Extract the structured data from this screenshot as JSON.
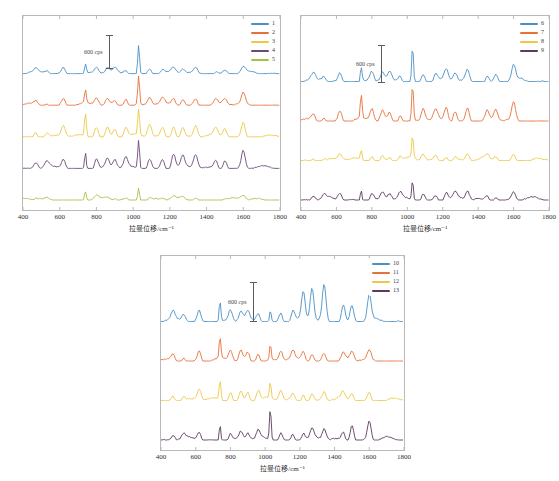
{
  "figure": {
    "background": "#ffffff",
    "frame_color": "#b9b9b9",
    "panel_count": 3
  },
  "axis": {
    "xlabel": "拉曼位移/cm⁻¹",
    "xticks": [
      "400",
      "600",
      "800",
      "1000",
      "1200",
      "1400",
      "1600",
      "1800"
    ],
    "xmin": 400,
    "xmax": 1800
  },
  "scalebar": {
    "label": "600 cps",
    "value": 600,
    "unit": "cps"
  },
  "colors": {
    "blue": "#4a90c4",
    "orange": "#e8703a",
    "yellow": "#edc847",
    "purple": "#6b4a77",
    "dark_purple": "#5b3a5e",
    "green": "#a8c04a"
  },
  "panels": [
    {
      "id": "panel-1",
      "legend": [
        {
          "label": "1",
          "color": "#4a90c4"
        },
        {
          "label": "2",
          "color": "#e8703a"
        },
        {
          "label": "3",
          "color": "#edc847"
        },
        {
          "label": "4",
          "color": "#6b4a77"
        },
        {
          "label": "5",
          "color": "#a8c04a"
        }
      ]
    },
    {
      "id": "panel-2",
      "legend": [
        {
          "label": "6",
          "color": "#4a90c4"
        },
        {
          "label": "7",
          "color": "#e8703a"
        },
        {
          "label": "8",
          "color": "#edc847"
        },
        {
          "label": "9",
          "color": "#5b3a5e"
        }
      ]
    },
    {
      "id": "panel-3",
      "legend": [
        {
          "label": "10",
          "color": "#4a90c4"
        },
        {
          "label": "11",
          "color": "#e8703a"
        },
        {
          "label": "12",
          "color": "#edc847"
        },
        {
          "label": "13",
          "color": "#5b3a5e"
        }
      ]
    }
  ],
  "chart_data": [
    {
      "type": "line",
      "title": "",
      "xlabel": "拉曼位移/cm⁻¹",
      "ylabel": "",
      "xlim": [
        400,
        1800
      ],
      "grid": false,
      "legend_position": "top-right",
      "note": "Stacked offset Raman spectra, samples 1-5. Intensity scale bar = 600 cps.",
      "series": [
        {
          "name": "1",
          "color": "#4a90c4",
          "offset_index": 0,
          "peaks_cm1": [
            470,
            530,
            620,
            740,
            800,
            860,
            900,
            960,
            1030,
            1090,
            1160,
            1220,
            1270,
            1340,
            1450,
            1500,
            1600
          ],
          "peak_rel_intensity": [
            0.12,
            0.1,
            0.2,
            0.34,
            0.2,
            0.17,
            0.14,
            0.13,
            1.0,
            0.22,
            0.13,
            0.16,
            0.15,
            0.18,
            0.11,
            0.12,
            0.19
          ]
        },
        {
          "name": "2",
          "color": "#e8703a",
          "offset_index": 1,
          "peaks_cm1": [
            470,
            530,
            620,
            740,
            800,
            860,
            900,
            960,
            1030,
            1090,
            1160,
            1220,
            1270,
            1340,
            1450,
            1500,
            1600
          ],
          "peak_rel_intensity": [
            0.14,
            0.12,
            0.26,
            0.45,
            0.25,
            0.22,
            0.18,
            0.3,
            1.0,
            0.28,
            0.2,
            0.24,
            0.22,
            0.26,
            0.18,
            0.2,
            0.4
          ]
        },
        {
          "name": "3",
          "color": "#edc847",
          "offset_index": 2,
          "peaks_cm1": [
            470,
            530,
            620,
            740,
            800,
            860,
            900,
            960,
            1030,
            1090,
            1160,
            1220,
            1270,
            1340,
            1450,
            1500,
            1600
          ],
          "peak_rel_intensity": [
            0.2,
            0.18,
            0.36,
            0.78,
            0.4,
            0.34,
            0.3,
            0.32,
            0.9,
            0.42,
            0.3,
            0.42,
            0.34,
            0.38,
            0.26,
            0.3,
            0.52
          ]
        },
        {
          "name": "4",
          "color": "#6b4a77",
          "offset_index": 3,
          "peaks_cm1": [
            470,
            530,
            620,
            740,
            800,
            860,
            900,
            960,
            1030,
            1090,
            1160,
            1220,
            1270,
            1340,
            1450,
            1500,
            1600
          ],
          "peak_rel_intensity": [
            0.22,
            0.2,
            0.34,
            0.6,
            0.36,
            0.32,
            0.3,
            0.34,
            1.0,
            0.38,
            0.34,
            0.52,
            0.4,
            0.46,
            0.3,
            0.36,
            0.62
          ]
        },
        {
          "name": "5",
          "color": "#a8c04a",
          "offset_index": 4,
          "peaks_cm1": [
            470,
            530,
            620,
            740,
            800,
            860,
            900,
            960,
            1030,
            1090,
            1160,
            1220,
            1270,
            1340,
            1450,
            1500,
            1600
          ],
          "peak_rel_intensity": [
            0.04,
            0.04,
            0.06,
            0.34,
            0.1,
            0.06,
            0.05,
            0.06,
            0.52,
            0.08,
            0.05,
            0.08,
            0.07,
            0.12,
            0.05,
            0.06,
            0.14
          ]
        }
      ]
    },
    {
      "type": "line",
      "title": "",
      "xlabel": "拉曼位移/cm⁻¹",
      "ylabel": "",
      "xlim": [
        400,
        1800
      ],
      "grid": false,
      "legend_position": "top-right",
      "note": "Stacked offset Raman spectra, samples 6-9. Intensity scale bar = 600 cps.",
      "series": [
        {
          "name": "6",
          "color": "#4a90c4",
          "offset_index": 0,
          "peaks_cm1": [
            470,
            530,
            620,
            740,
            800,
            860,
            900,
            960,
            1030,
            1090,
            1160,
            1220,
            1270,
            1340,
            1450,
            1500,
            1600
          ],
          "peak_rel_intensity": [
            0.16,
            0.14,
            0.24,
            0.4,
            0.26,
            0.22,
            0.2,
            0.18,
            1.0,
            0.26,
            0.2,
            0.3,
            0.24,
            0.3,
            0.18,
            0.2,
            0.42
          ]
        },
        {
          "name": "7",
          "color": "#e8703a",
          "offset_index": 1,
          "peaks_cm1": [
            470,
            530,
            620,
            740,
            800,
            860,
            900,
            960,
            1030,
            1090,
            1160,
            1220,
            1270,
            1340,
            1450,
            1500,
            1600
          ],
          "peak_rel_intensity": [
            0.18,
            0.16,
            0.3,
            0.66,
            0.34,
            0.28,
            0.24,
            0.24,
            1.0,
            0.34,
            0.26,
            0.38,
            0.3,
            0.4,
            0.24,
            0.28,
            0.48
          ]
        },
        {
          "name": "8",
          "color": "#edc847",
          "offset_index": 2,
          "peaks_cm1": [
            470,
            530,
            620,
            740,
            800,
            860,
            900,
            960,
            1030,
            1090,
            1160,
            1220,
            1270,
            1340,
            1450,
            1500,
            1600
          ],
          "peak_rel_intensity": [
            0.1,
            0.08,
            0.16,
            0.24,
            0.18,
            0.14,
            0.12,
            0.12,
            0.62,
            0.18,
            0.12,
            0.18,
            0.14,
            0.18,
            0.1,
            0.12,
            0.2
          ]
        },
        {
          "name": "9",
          "color": "#5b3a5e",
          "offset_index": 3,
          "peaks_cm1": [
            470,
            530,
            620,
            740,
            800,
            860,
            900,
            960,
            1030,
            1090,
            1160,
            1220,
            1270,
            1340,
            1450,
            1500,
            1600
          ],
          "peak_rel_intensity": [
            0.12,
            0.1,
            0.2,
            0.32,
            0.22,
            0.18,
            0.16,
            0.16,
            0.56,
            0.22,
            0.16,
            0.24,
            0.18,
            0.24,
            0.14,
            0.16,
            0.24
          ]
        }
      ]
    },
    {
      "type": "line",
      "title": "",
      "xlabel": "拉曼位移/cm⁻¹",
      "ylabel": "",
      "xlim": [
        400,
        1800
      ],
      "grid": false,
      "legend_position": "top-right",
      "note": "Stacked offset Raman spectra, samples 10-13. Intensity scale bar = 600 cps.",
      "series": [
        {
          "name": "10",
          "color": "#4a90c4",
          "offset_index": 0,
          "peaks_cm1": [
            470,
            530,
            620,
            740,
            800,
            860,
            900,
            960,
            1030,
            1090,
            1160,
            1220,
            1270,
            1340,
            1450,
            1500,
            1600
          ],
          "peak_rel_intensity": [
            0.22,
            0.2,
            0.3,
            0.56,
            0.3,
            0.26,
            0.24,
            0.26,
            0.34,
            0.28,
            0.3,
            0.78,
            0.92,
            1.0,
            0.5,
            0.44,
            0.7
          ]
        },
        {
          "name": "11",
          "color": "#e8703a",
          "offset_index": 1,
          "peaks_cm1": [
            470,
            530,
            620,
            740,
            800,
            860,
            900,
            960,
            1030,
            1090,
            1160,
            1220,
            1270,
            1340,
            1450,
            1500,
            1600
          ],
          "peak_rel_intensity": [
            0.18,
            0.16,
            0.3,
            0.58,
            0.3,
            0.28,
            0.26,
            0.28,
            0.46,
            0.28,
            0.22,
            0.26,
            0.22,
            0.26,
            0.2,
            0.22,
            0.26
          ]
        },
        {
          "name": "12",
          "color": "#edc847",
          "offset_index": 2,
          "peaks_cm1": [
            470,
            530,
            620,
            740,
            800,
            860,
            900,
            960,
            1030,
            1090,
            1160,
            1220,
            1270,
            1340,
            1450,
            1500,
            1600
          ],
          "peak_rel_intensity": [
            0.18,
            0.16,
            0.3,
            0.54,
            0.3,
            0.28,
            0.26,
            0.28,
            0.44,
            0.28,
            0.2,
            0.24,
            0.2,
            0.24,
            0.18,
            0.2,
            0.24
          ]
        },
        {
          "name": "13",
          "color": "#5b3a5e",
          "offset_index": 3,
          "peaks_cm1": [
            470,
            530,
            620,
            740,
            800,
            860,
            900,
            960,
            1030,
            1090,
            1160,
            1220,
            1270,
            1340,
            1450,
            1500,
            1600
          ],
          "peak_rel_intensity": [
            0.14,
            0.12,
            0.22,
            0.48,
            0.22,
            0.2,
            0.18,
            0.22,
            0.9,
            0.24,
            0.18,
            0.22,
            0.26,
            0.3,
            0.24,
            0.48,
            0.52
          ]
        }
      ]
    }
  ]
}
